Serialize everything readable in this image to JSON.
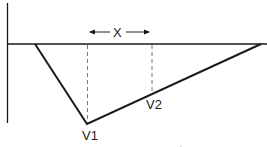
{
  "diagram": {
    "labels": {
      "distance": "X",
      "point1": "V1",
      "point2": "V2"
    },
    "colors": {
      "line": "#1a1a1a",
      "background": "#ffffff"
    }
  }
}
